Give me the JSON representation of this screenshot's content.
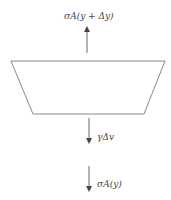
{
  "diagram": {
    "type": "free-body-diagram",
    "colors": {
      "stroke": "#7a7a7a",
      "arrow": "#555555",
      "text": "#444444",
      "background": "#ffffff"
    },
    "body": {
      "shape": "trapezoid",
      "top_width": "wide",
      "bottom_width": "narrow"
    },
    "forces": {
      "top": {
        "label": "σA(y + Δy)",
        "direction": "up"
      },
      "weight": {
        "label": "γΔv",
        "direction": "down"
      },
      "bottom": {
        "label": "σA(y)",
        "direction": "down"
      }
    }
  }
}
